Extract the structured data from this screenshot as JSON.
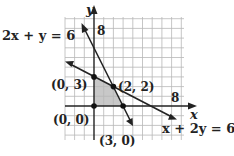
{
  "diagram": {
    "type": "linear-programming-feasible-region",
    "axes": {
      "x_label": "x",
      "y_label": "y",
      "x_tick_label": "8",
      "y_tick_label": "8"
    },
    "lines": [
      {
        "equation": "2x + y = 6",
        "label": "2x + y = 6"
      },
      {
        "equation": "x + 2y = 6",
        "label": "x + 2y = 6"
      }
    ],
    "vertices": [
      {
        "label": "(0, 3)",
        "x": 0,
        "y": 3
      },
      {
        "label": "(2, 2)",
        "x": 2,
        "y": 2
      },
      {
        "label": "(0, 0)",
        "x": 0,
        "y": 0
      },
      {
        "label": "(3, 0)",
        "x": 3,
        "y": 0
      }
    ],
    "colors": {
      "shade": "#c8c8c8",
      "grid": "#b8b8b8",
      "ink": "#222222"
    }
  }
}
